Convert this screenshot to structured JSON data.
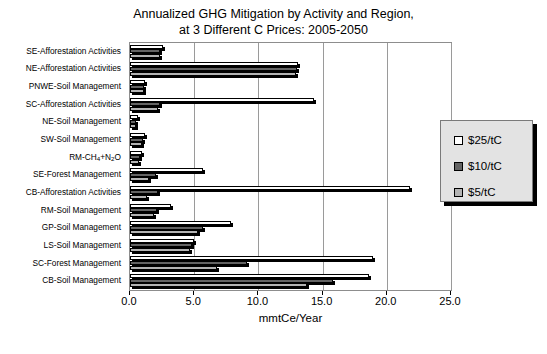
{
  "chart_data": {
    "type": "bar",
    "orientation": "horizontal",
    "title": "Annualized GHG Mitigation by Activity and Region,\nat 3 Different C Prices: 2005-2050",
    "title_line1": "Annualized GHG Mitigation by Activity and Region,",
    "title_line2": "at 3 Different C Prices: 2005-2050",
    "xlabel": "mmtCe/Year",
    "ylabel": "",
    "xlim": [
      0.0,
      25.0
    ],
    "xticks": [
      0.0,
      5.0,
      10.0,
      15.0,
      20.0,
      25.0
    ],
    "xticklabels": [
      "0.0",
      "5.0",
      "10.0",
      "15.0",
      "20.0",
      "25.0"
    ],
    "grid": true,
    "legend_position": "right",
    "categories": [
      "SE-Afforestation Activities",
      "NE-Afforestation Activities",
      "PNWE-Soil Management",
      "SC-Afforestation Activities",
      "NE-Soil Management",
      "SW-Soil Management",
      "RM-CH4+N2O",
      "SE-Forest Management",
      "CB-Afforestation Activities",
      "RM-Soil Management",
      "GP-Soil Management",
      "LS-Soil Management",
      "SC-Forest Management",
      "CB-Soil Management"
    ],
    "category_labels_html": [
      "SE-Afforestation Activities",
      "NE-Afforestation Activities",
      "PNWE-Soil Management",
      "SC-Afforestation Activities",
      "NE-Soil Management",
      "SW-Soil Management",
      "RM-CH<sub>4</sub>+N<sub>2</sub>O",
      "SE-Forest Management",
      "CB-Afforestation Activities",
      "RM-Soil Management",
      "GP-Soil Management",
      "LS-Soil Management",
      "SC-Forest Management",
      "CB-Soil Management"
    ],
    "series": [
      {
        "name": "$25/tC",
        "color": "#ffffff",
        "values": [
          2.6,
          13.1,
          1.2,
          14.3,
          0.6,
          1.2,
          0.9,
          5.7,
          21.8,
          3.2,
          7.9,
          5.0,
          18.9,
          18.6
        ]
      },
      {
        "name": "$10/tC",
        "color": "#636363",
        "values": [
          2.3,
          13.0,
          1.1,
          2.3,
          0.5,
          1.0,
          0.8,
          2.0,
          2.2,
          2.1,
          5.7,
          4.8,
          9.1,
          15.8
        ]
      },
      {
        "name": "$5/tC",
        "color": "#b3b3b3",
        "values": [
          2.3,
          12.9,
          1.1,
          2.2,
          0.5,
          0.9,
          0.7,
          1.5,
          1.3,
          1.9,
          5.3,
          4.7,
          6.8,
          13.8
        ]
      }
    ]
  },
  "legend": {
    "items": [
      {
        "label": "$25/tC",
        "color": "#ffffff"
      },
      {
        "label": "$10/tC",
        "color": "#636363"
      },
      {
        "label": "$5/tC",
        "color": "#b3b3b3"
      }
    ]
  }
}
